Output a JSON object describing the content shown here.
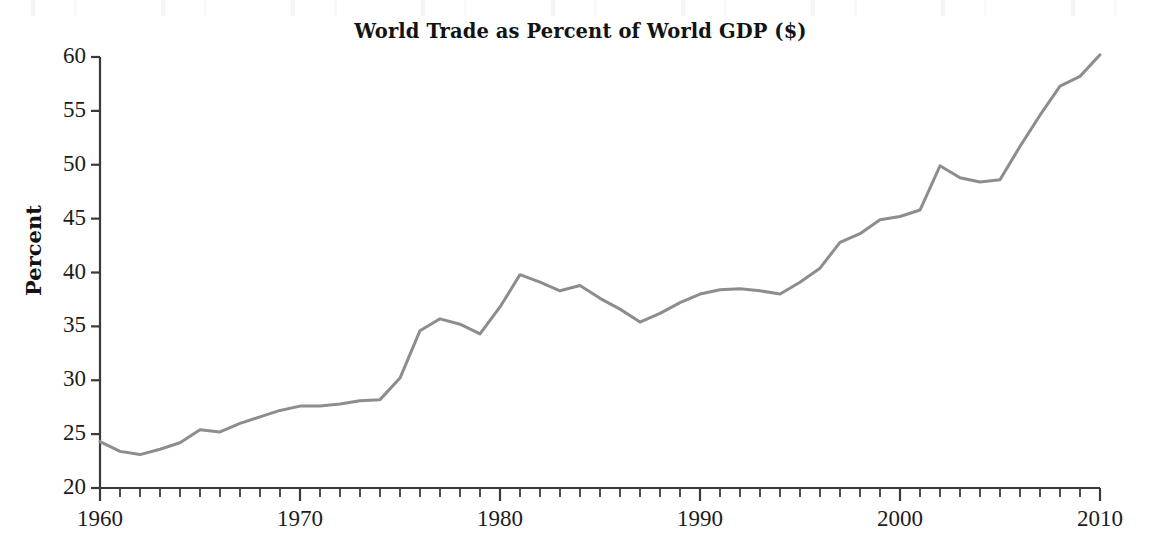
{
  "chart_data": {
    "type": "line",
    "title": "World Trade as Percent of World GDP ($)",
    "xlabel": "",
    "ylabel": "Percent",
    "xlim": [
      1960,
      2010
    ],
    "ylim": [
      20,
      60
    ],
    "ytick_step": 5,
    "xtick_step": 10,
    "x_minor_tick_step": 1,
    "grid": false,
    "legend": null,
    "line_color": "#8d8d8d",
    "line_width": 3,
    "axis_color": "#3a3a3a",
    "ytick_labels": [
      "60",
      "55",
      "50",
      "45",
      "40",
      "35",
      "30",
      "25",
      "20"
    ],
    "xtick_labels": [
      "1960",
      "1970",
      "1980",
      "1990",
      "2000",
      "2010"
    ],
    "series": [
      {
        "name": "World trade as percent of world GDP",
        "x": [
          1960,
          1961,
          1962,
          1963,
          1964,
          1965,
          1966,
          1967,
          1968,
          1969,
          1970,
          1971,
          1972,
          1973,
          1974,
          1975,
          1976,
          1977,
          1978,
          1979,
          1980,
          1981,
          1982,
          1983,
          1984,
          1985,
          1986,
          1987,
          1988,
          1989,
          1990,
          1991,
          1992,
          1993,
          1994,
          1995,
          1996,
          1997,
          1998,
          1999,
          2000,
          2001,
          2002,
          2003,
          2004,
          2005,
          2006,
          2007,
          2008,
          2009,
          2010
        ],
        "values": [
          24.3,
          23.4,
          23.1,
          23.6,
          24.2,
          25.4,
          25.2,
          26.0,
          26.6,
          27.2,
          27.6,
          27.6,
          27.8,
          28.1,
          28.2,
          30.2,
          34.6,
          35.7,
          35.2,
          34.3,
          36.8,
          39.8,
          39.1,
          38.3,
          38.8,
          37.6,
          36.6,
          35.4,
          36.2,
          37.2,
          38.0,
          38.4,
          38.5,
          38.3,
          38.0,
          39.1,
          40.4,
          42.8,
          43.6,
          44.9,
          45.2,
          45.8,
          49.9,
          48.8,
          48.4,
          48.6,
          51.7,
          54.6,
          57.3,
          58.2,
          60.2
        ]
      }
    ],
    "annotations": []
  }
}
